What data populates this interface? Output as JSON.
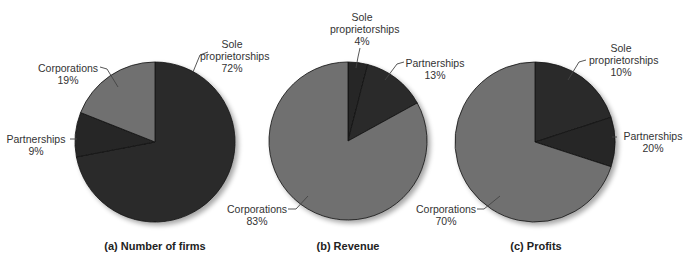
{
  "colors": {
    "dark": "#2b2b2b",
    "darker": "#262626",
    "medium": "#707070",
    "edge": "#111111",
    "leader": "#444444"
  },
  "chart_data": [
    {
      "type": "pie",
      "title": "(a) Number of firms",
      "categories": [
        "Sole proprietorships",
        "Partnerships",
        "Corporations"
      ],
      "values": [
        72,
        9,
        19
      ],
      "labels": [
        "Sole proprietorships 72%",
        "Partnerships 9%",
        "Corporations 19%"
      ],
      "start_angle": "12 o'clock, clockwise"
    },
    {
      "type": "pie",
      "title": "(b) Revenue",
      "categories": [
        "Sole proprietorships",
        "Partnerships",
        "Corporations"
      ],
      "values": [
        4,
        13,
        83
      ],
      "labels": [
        "Sole proprietorships 4%",
        "Partnerships 13%",
        "Corporations 83%"
      ],
      "start_angle": "12 o'clock, clockwise"
    },
    {
      "type": "pie",
      "title": "(c) Profits",
      "categories": [
        "Sole proprietorships",
        "Partnerships",
        "Corporations"
      ],
      "values": [
        10,
        20,
        70
      ],
      "labels": [
        "Sole proprietorships 10%",
        "Partnerships 20%",
        "Corporations 70%"
      ],
      "start_angle": "12 o'clock, clockwise"
    }
  ],
  "pies": [
    {
      "cx": 155,
      "cy": 142,
      "r": 80,
      "drawn_values": [
        72,
        9,
        19
      ],
      "fills": [
        "dark",
        "darker",
        "medium"
      ],
      "caption": "(a) Number of firms",
      "caption_x": 155,
      "labels": [
        {
          "line1": "Sole",
          "line2": "proprietorships",
          "line3": "72%",
          "x": 232,
          "y": 38,
          "leader": [
            [
              208,
              52
            ],
            [
              200,
              55
            ],
            [
              193,
              72
            ]
          ]
        },
        {
          "line1": "Partnerships",
          "line2": "9%",
          "x": 34,
          "y": 135,
          "leader": [
            [
              70,
              139
            ],
            [
              77,
              139
            ]
          ]
        },
        {
          "line1": "Corporations",
          "line2": "19%",
          "x": 68,
          "y": 62,
          "leader": [
            [
              100,
              67
            ],
            [
              107,
              69
            ],
            [
              118,
              87
            ]
          ]
        }
      ]
    },
    {
      "cx": 348,
      "cy": 141,
      "r": 79,
      "drawn_values": [
        4,
        13,
        83
      ],
      "fills": [
        "darker",
        "dark",
        "medium"
      ],
      "caption": "(b) Revenue",
      "caption_x": 348,
      "labels": [
        {
          "line1": "Sole",
          "line2": "proprietorships",
          "line3": "4%",
          "x": 362,
          "y": 12,
          "leader": [
            [
              360,
              48
            ],
            [
              358,
              57
            ],
            [
              356,
              68
            ]
          ]
        },
        {
          "line1": "Partnerships",
          "line2": "13%",
          "x": 438,
          "y": 58,
          "leader": [
            [
              404,
              62
            ],
            [
              397,
              64
            ],
            [
              385,
              80
            ]
          ]
        },
        {
          "line1": "Corporations",
          "line2": "83%",
          "x": 258,
          "y": 203,
          "leader": [
            [
              288,
              209
            ],
            [
              296,
              209
            ],
            [
              308,
              196
            ]
          ]
        }
      ]
    },
    {
      "cx": 535,
      "cy": 142,
      "r": 80,
      "drawn_values": [
        20,
        10,
        70
      ],
      "fills": [
        "dark",
        "darker",
        "medium"
      ],
      "caption": "(c) Profits",
      "caption_x": 536,
      "labels": [
        {
          "line1": "Sole",
          "line2": "proprietorships",
          "line3": "10%",
          "x": 621,
          "y": 42,
          "leader": [
            [
              586,
              60
            ],
            [
              579,
              62
            ],
            [
              568,
              80
            ]
          ]
        },
        {
          "line1": "Partnerships",
          "line2": "20%",
          "x": 653,
          "y": 128,
          "leader": [
            [
              617,
              137
            ],
            [
              612,
              137
            ]
          ]
        },
        {
          "line1": "Corporations",
          "line2": "70%",
          "x": 467,
          "y": 203,
          "leader": [
            [
              477,
              209
            ],
            [
              484,
              209
            ],
            [
              500,
              196
            ]
          ]
        }
      ]
    }
  ]
}
